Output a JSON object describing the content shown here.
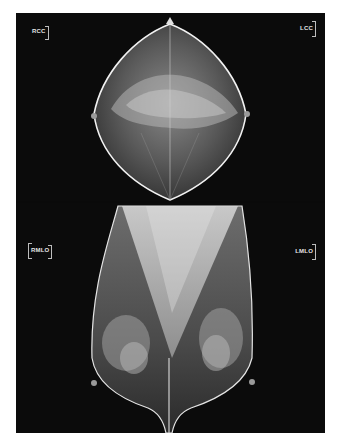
{
  "image": {
    "description": "Bilateral screening mammogram composite: craniocaudal views (top) and mediolateral oblique views (bottom)",
    "background_color": "#0b0b0b",
    "page_color": "#ffffff"
  },
  "views": {
    "top": {
      "left_label": "RCC",
      "right_label": "LCC"
    },
    "bottom": {
      "left_label": "RMLO",
      "right_label": "LMLO"
    }
  }
}
